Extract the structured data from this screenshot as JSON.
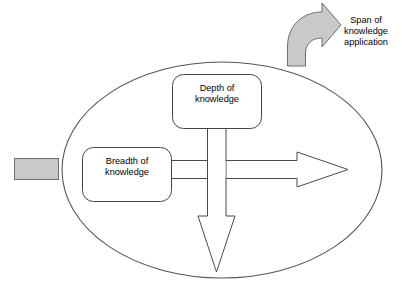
{
  "diagram": {
    "background_color": "#ffffff",
    "shapes": {
      "boundary_ellipse": {
        "name": "knowledge-domain-ellipse",
        "fill": "#ffffff",
        "stroke": "#555555"
      },
      "input_tab": {
        "name": "input-tab",
        "fill": "#c9c9c9",
        "stroke": "#6e6e6e"
      },
      "span_arrow": {
        "name": "span-curved-arrow",
        "fill": "#c9c9c9",
        "stroke": "#6e6e6e",
        "direction": "curves up and to the right out of the ellipse"
      },
      "breadth_arrow": {
        "name": "breadth-horizontal-arrow",
        "fill": "#ffffff",
        "stroke": "#4a4a4a",
        "direction": "right"
      },
      "depth_arrow": {
        "name": "depth-vertical-arrow",
        "fill": "#ffffff",
        "stroke": "#4a4a4a",
        "direction": "down"
      }
    },
    "labels": {
      "depth": "Depth of\nknowledge",
      "breadth": "Breadth of\nknowledge",
      "span": "Span of\nknowledge\napplication"
    }
  }
}
